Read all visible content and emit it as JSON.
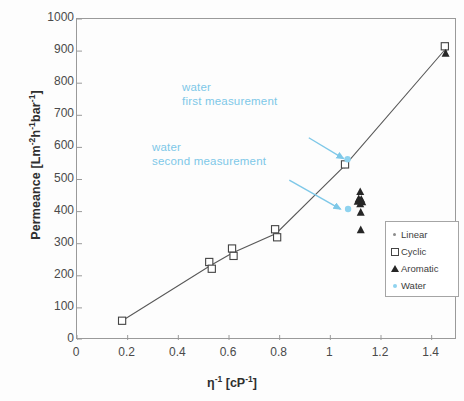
{
  "chart_data": {
    "type": "scatter",
    "title": "",
    "xlabel": "η⁻¹ [cP⁻¹]",
    "ylabel": "Permeance [Lm⁻²h⁻¹bar⁻¹]",
    "xlim": [
      0,
      1.5
    ],
    "ylim": [
      0,
      1000
    ],
    "xticks": [
      0,
      0.2,
      0.4,
      0.6,
      0.8,
      1,
      1.2,
      1.4
    ],
    "xticklabels": [
      "0",
      "0.2",
      "0.4",
      "0.6",
      "0.8",
      "1",
      "1.2",
      "1.4"
    ],
    "yticks": [
      0,
      100,
      200,
      300,
      400,
      500,
      600,
      700,
      800,
      900,
      1000
    ],
    "yticklabels": [
      "0",
      "100",
      "200",
      "300",
      "400",
      "500",
      "600",
      "700",
      "800",
      "900",
      "1000"
    ],
    "grid": false,
    "legend_position": "lower right",
    "series": [
      {
        "name": "Linear",
        "marker": "small-circle",
        "color": "#8c8c8c",
        "points": [
          {
            "x": 0.525,
            "y": 232
          },
          {
            "x": 0.615,
            "y": 272
          },
          {
            "x": 0.787,
            "y": 332
          },
          {
            "x": 1.055,
            "y": 540
          },
          {
            "x": 1.455,
            "y": 900
          }
        ]
      },
      {
        "name": "Cyclic",
        "marker": "open-square",
        "color": "#444444",
        "points": [
          {
            "x": 0.178,
            "y": 60
          },
          {
            "x": 0.522,
            "y": 243
          },
          {
            "x": 0.532,
            "y": 222
          },
          {
            "x": 0.612,
            "y": 285
          },
          {
            "x": 0.618,
            "y": 262
          },
          {
            "x": 0.782,
            "y": 345
          },
          {
            "x": 0.79,
            "y": 320
          },
          {
            "x": 1.058,
            "y": 547
          },
          {
            "x": 1.452,
            "y": 915
          }
        ]
      },
      {
        "name": "Aromatic",
        "marker": "filled-triangle",
        "color": "#262626",
        "points": [
          {
            "x": 1.118,
            "y": 462
          },
          {
            "x": 1.112,
            "y": 440
          },
          {
            "x": 1.122,
            "y": 438
          },
          {
            "x": 1.108,
            "y": 432
          },
          {
            "x": 1.126,
            "y": 430
          },
          {
            "x": 1.118,
            "y": 424
          },
          {
            "x": 1.12,
            "y": 398
          },
          {
            "x": 1.12,
            "y": 343
          },
          {
            "x": 1.455,
            "y": 893
          }
        ]
      },
      {
        "name": "Water",
        "marker": "filled-circle",
        "color": "#8fd3ef",
        "points": [
          {
            "x": 1.068,
            "y": 563
          },
          {
            "x": 1.07,
            "y": 408
          }
        ]
      }
    ],
    "trendline": {
      "name": "connecting-line",
      "color": "#595959",
      "points": [
        {
          "x": 0.178,
          "y": 60
        },
        {
          "x": 0.527,
          "y": 232
        },
        {
          "x": 0.615,
          "y": 272
        },
        {
          "x": 0.786,
          "y": 332
        },
        {
          "x": 1.057,
          "y": 543
        },
        {
          "x": 1.453,
          "y": 905
        }
      ]
    },
    "annotations": [
      {
        "name": "water-first-measurement",
        "line1": "water",
        "line2": "first measurement",
        "color": "#7ec8e8",
        "arrow_from": {
          "x": 0.915,
          "y": 630
        },
        "arrow_to": {
          "x": 1.052,
          "y": 565
        }
      },
      {
        "name": "water-second-measurement",
        "line1": "water",
        "line2": "second measurement",
        "color": "#7ec8e8",
        "arrow_from": {
          "x": 0.838,
          "y": 498
        },
        "arrow_to": {
          "x": 1.04,
          "y": 408
        }
      }
    ]
  },
  "legend": {
    "items": [
      {
        "label": "Linear",
        "marker": "small-circle"
      },
      {
        "label": "Cyclic",
        "marker": "open-square"
      },
      {
        "label": "Aromatic",
        "marker": "filled-triangle"
      },
      {
        "label": "Water",
        "marker": "filled-circle"
      }
    ]
  },
  "axes": {
    "y_title_main": "Permeance [Lm",
    "x_title_main": "η"
  }
}
